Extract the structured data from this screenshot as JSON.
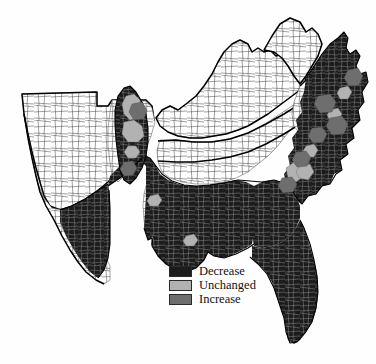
{
  "figure": {
    "type": "choropleth-map",
    "name": "us-southeast-county-change-map",
    "background_color": "#fefefe",
    "width": 376,
    "height": 364
  },
  "legend": {
    "name": "map-legend",
    "items": [
      {
        "label": "Decrease",
        "color": "#1c1c1c",
        "swatch_name": "legend-swatch-decrease"
      },
      {
        "label": "Unchanged",
        "color": "#b2b2b2",
        "swatch_name": "legend-swatch-unchanged"
      },
      {
        "label": "Increase",
        "color": "#6e6e6e",
        "swatch_name": "legend-swatch-increase"
      }
    ]
  },
  "map": {
    "name": "county-choropleth",
    "classification_colors": {
      "decrease": "#1c1c1c",
      "unchanged": "#b2b2b2",
      "increase": "#6e6e6e",
      "not_classified": "#ffffff"
    },
    "outline_color": "#000000",
    "county_line_color_light": "#3a3a3a",
    "county_line_color_dark": "#8d8d8d",
    "regions": [
      {
        "name": "oklahoma-unshaded",
        "classification": "not_classified"
      },
      {
        "name": "arkansas-unshaded",
        "classification": "not_classified"
      },
      {
        "name": "texas-coastal-unshaded",
        "classification": "not_classified"
      },
      {
        "name": "kentucky-unshaded",
        "classification": "not_classified"
      },
      {
        "name": "tennessee-central-unshaded",
        "classification": "not_classified"
      },
      {
        "name": "west-virginia-unshaded",
        "classification": "not_classified"
      },
      {
        "name": "virginia-western-unshaded",
        "classification": "not_classified"
      },
      {
        "name": "louisiana-delta-unshaded",
        "classification": "not_classified"
      },
      {
        "name": "florida-panhandle-unshaded",
        "classification": "not_classified"
      },
      {
        "name": "east-texas-decrease",
        "classification": "decrease"
      },
      {
        "name": "louisiana-decrease",
        "classification": "decrease"
      },
      {
        "name": "mississippi-decrease",
        "classification": "decrease"
      },
      {
        "name": "alabama-decrease",
        "classification": "decrease"
      },
      {
        "name": "georgia-decrease",
        "classification": "decrease"
      },
      {
        "name": "florida-peninsula-decrease",
        "classification": "decrease"
      },
      {
        "name": "mississippi-delta-decrease",
        "classification": "decrease"
      },
      {
        "name": "carolina-coastal-plain-decrease",
        "classification": "decrease"
      },
      {
        "name": "virginia-tidewater-decrease",
        "classification": "decrease"
      },
      {
        "name": "delta-unchanged-patch",
        "classification": "unchanged"
      },
      {
        "name": "carolina-unchanged-patches",
        "classification": "unchanged"
      },
      {
        "name": "virginia-increase-patches",
        "classification": "increase"
      },
      {
        "name": "delta-increase-patch",
        "classification": "increase"
      }
    ]
  }
}
